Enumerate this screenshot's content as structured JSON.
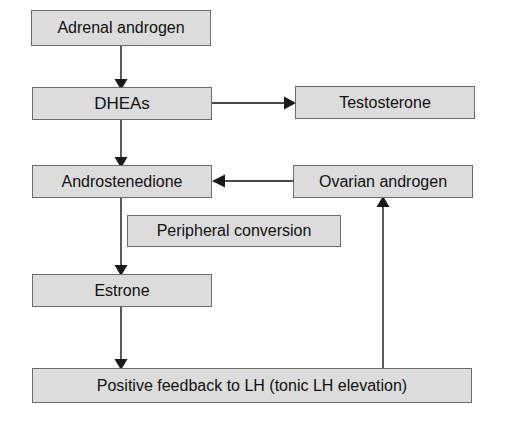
{
  "diagram": {
    "colors": {
      "node_fill": "#dcdcdc",
      "node_border": "#6b6b6b",
      "connector": "#4a4a4a",
      "text": "#111111",
      "background": "#ffffff"
    },
    "nodes": [
      {
        "id": "adrenal_androgen",
        "label": "Adrenal androgen"
      },
      {
        "id": "dheas",
        "label": "DHEAs"
      },
      {
        "id": "testosterone",
        "label": "Testosterone"
      },
      {
        "id": "androstenedione",
        "label": "Androstenedione"
      },
      {
        "id": "ovarian_androgen",
        "label": "Ovarian androgen"
      },
      {
        "id": "peripheral_conversion",
        "label": "Peripheral conversion"
      },
      {
        "id": "estrone",
        "label": "Estrone"
      },
      {
        "id": "positive_feedback",
        "label": "Positive feedback to LH (tonic LH elevation)"
      }
    ],
    "edges": [
      {
        "id": "adrenal_to_dheas",
        "from": "adrenal_androgen",
        "to": "dheas",
        "direction": "down",
        "arrowhead": "filled-triangle"
      },
      {
        "id": "dheas_to_testosterone",
        "from": "dheas",
        "to": "testosterone",
        "direction": "right",
        "arrowhead": "filled-triangle"
      },
      {
        "id": "dheas_to_androstenedione",
        "from": "dheas",
        "to": "androstenedione",
        "direction": "down",
        "arrowhead": "filled-triangle"
      },
      {
        "id": "ovarian_to_androstenedione",
        "from": "ovarian_androgen",
        "to": "androstenedione",
        "direction": "left",
        "arrowhead": "filled-triangle"
      },
      {
        "id": "androstenedione_to_estrone",
        "from": "androstenedione",
        "to": "estrone",
        "direction": "down",
        "arrowhead": "filled-triangle"
      },
      {
        "id": "estrone_to_positive_feedback",
        "from": "estrone",
        "to": "positive_feedback",
        "direction": "down",
        "arrowhead": "filled-triangle"
      },
      {
        "id": "feedback_to_ovarian",
        "from": "positive_feedback",
        "to": "ovarian_androgen",
        "direction": "up",
        "arrowhead": "filled-triangle"
      }
    ]
  }
}
